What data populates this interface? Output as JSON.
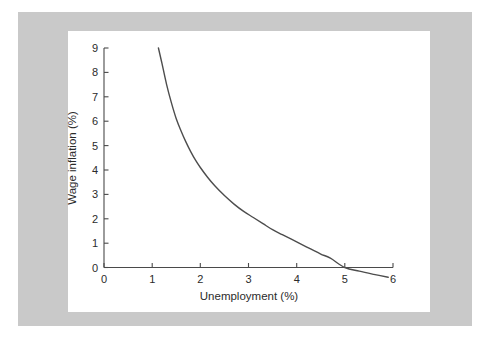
{
  "figure": {
    "background_color": "#ffffff",
    "frame_color": "#c9c9c9",
    "panel_color": "#ffffff",
    "curve_color": "#4d4d4d",
    "axis_color": "#4a4a4a"
  },
  "chart_data": {
    "type": "line",
    "title": "",
    "subtitle": "",
    "xlabel": "Unemployment (%)",
    "ylabel": "Wage inflation (%)",
    "xlim": [
      0,
      6
    ],
    "ylim": [
      0,
      9
    ],
    "xticks": [
      0,
      1,
      2,
      3,
      4,
      5,
      6
    ],
    "xtick_labels": [
      "0",
      "1",
      "2",
      "3",
      "4",
      "5",
      "6"
    ],
    "yticks": [
      0,
      1,
      2,
      3,
      4,
      5,
      6,
      7,
      8,
      9
    ],
    "ytick_labels": [
      "0",
      "1",
      "2",
      "3",
      "4",
      "5",
      "6",
      "7",
      "8",
      "9"
    ],
    "grid": false,
    "legend": null,
    "legend_position": "none",
    "annotations": [],
    "series": [
      {
        "name": "Phillips curve",
        "x": [
          1.13,
          1.2,
          1.3,
          1.4,
          1.5,
          1.6,
          1.7,
          1.8,
          1.9,
          2.0,
          2.15,
          2.3,
          2.5,
          2.7,
          2.9,
          3.1,
          3.3,
          3.5,
          3.7,
          3.9,
          4.1,
          4.3,
          4.5,
          4.7,
          5.0,
          5.3,
          5.6,
          5.9
        ],
        "y": [
          9.0,
          8.4,
          7.5,
          6.75,
          6.1,
          5.6,
          5.15,
          4.75,
          4.4,
          4.1,
          3.7,
          3.35,
          2.95,
          2.6,
          2.3,
          2.05,
          1.8,
          1.55,
          1.35,
          1.15,
          0.95,
          0.75,
          0.55,
          0.38,
          0.0,
          -0.15,
          -0.28,
          -0.4
        ]
      }
    ]
  }
}
